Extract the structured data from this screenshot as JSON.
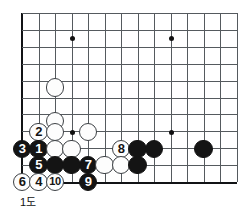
{
  "figure": {
    "caption": "1도",
    "caption_x": 20,
    "caption_y": 193,
    "width": 243,
    "height": 211,
    "background": "#ffffff"
  },
  "board": {
    "origin_x": 22,
    "origin_y": 13,
    "col_spacing": 16.5,
    "row_spacing": 16.9,
    "cols": 14,
    "rows": 11,
    "line_color": "#555a5e",
    "edge_color": "#111315",
    "stone_radius": 9.2,
    "left_edge_col": 0,
    "top_edge_row": 0,
    "bottom_edge_row": 10,
    "star_points": [
      {
        "col": 3,
        "row": 1.45
      },
      {
        "col": 9,
        "row": 1.45
      },
      {
        "col": 3,
        "row": 7.05
      },
      {
        "col": 9,
        "row": 7.05
      }
    ]
  },
  "stones": [
    {
      "id": "w-a",
      "color": "white",
      "col": 2,
      "row": 4.4,
      "label": ""
    },
    {
      "id": "w-b",
      "color": "white",
      "col": 2,
      "row": 6.4,
      "label": ""
    },
    {
      "id": "w-2",
      "color": "white",
      "col": 1,
      "row": 7.05,
      "label": "2"
    },
    {
      "id": "w-c",
      "color": "white",
      "col": 2,
      "row": 7.05,
      "label": ""
    },
    {
      "id": "w-d",
      "color": "white",
      "col": 4,
      "row": 7.05,
      "label": ""
    },
    {
      "id": "b-3",
      "color": "black",
      "col": 0,
      "row": 8.05,
      "label": "3"
    },
    {
      "id": "b-1",
      "color": "black",
      "col": 1,
      "row": 8.05,
      "label": "1"
    },
    {
      "id": "w-e",
      "color": "white",
      "col": 2,
      "row": 8.05,
      "label": ""
    },
    {
      "id": "w-f",
      "color": "white",
      "col": 3,
      "row": 8.05,
      "label": ""
    },
    {
      "id": "w-8",
      "color": "white",
      "col": 6,
      "row": 8.05,
      "label": "8"
    },
    {
      "id": "b-g",
      "color": "black",
      "col": 7,
      "row": 8.05,
      "label": ""
    },
    {
      "id": "b-h",
      "color": "black",
      "col": 8,
      "row": 8.05,
      "label": ""
    },
    {
      "id": "b-i",
      "color": "black",
      "col": 11,
      "row": 8.05,
      "label": ""
    },
    {
      "id": "b-5",
      "color": "black",
      "col": 1,
      "row": 9.0,
      "label": "5"
    },
    {
      "id": "b-j",
      "color": "black",
      "col": 2,
      "row": 9.0,
      "label": ""
    },
    {
      "id": "b-k",
      "color": "black",
      "col": 3,
      "row": 9.0,
      "label": ""
    },
    {
      "id": "b-7",
      "color": "black",
      "col": 4,
      "row": 9.0,
      "label": "7"
    },
    {
      "id": "w-l",
      "color": "white",
      "col": 5,
      "row": 9.0,
      "label": ""
    },
    {
      "id": "w-m",
      "color": "white",
      "col": 6,
      "row": 9.0,
      "label": ""
    },
    {
      "id": "b-n",
      "color": "black",
      "col": 7,
      "row": 9.0,
      "label": ""
    },
    {
      "id": "w-6",
      "color": "white",
      "col": 0,
      "row": 10.0,
      "label": "6"
    },
    {
      "id": "w-4",
      "color": "white",
      "col": 1,
      "row": 10.0,
      "label": "4"
    },
    {
      "id": "w-10",
      "color": "white",
      "col": 2,
      "row": 10.0,
      "label": "10"
    },
    {
      "id": "b-9",
      "color": "black",
      "col": 4,
      "row": 10.0,
      "label": "9"
    }
  ],
  "move_sequence": {
    "black_moves": [
      "1",
      "3",
      "5",
      "7",
      "9"
    ],
    "white_moves": [
      "2",
      "4",
      "6",
      "8",
      "10"
    ]
  }
}
